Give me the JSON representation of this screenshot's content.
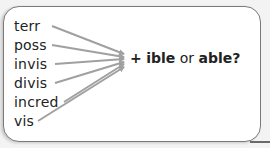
{
  "diagram": {
    "words": [
      {
        "text": "terr",
        "y": 18
      },
      {
        "text": "poss",
        "y": 37
      },
      {
        "text": "invis",
        "y": 56
      },
      {
        "text": "divis",
        "y": 75
      },
      {
        "text": "incred",
        "y": 94
      },
      {
        "text": "vis",
        "y": 113
      }
    ],
    "target": {
      "plus": "+",
      "option1": "ible",
      "connector": "or",
      "option2": "able?"
    },
    "colors": {
      "arrow": "#a0a0a0",
      "text": "#222222",
      "border": "#7a7a7a"
    }
  }
}
